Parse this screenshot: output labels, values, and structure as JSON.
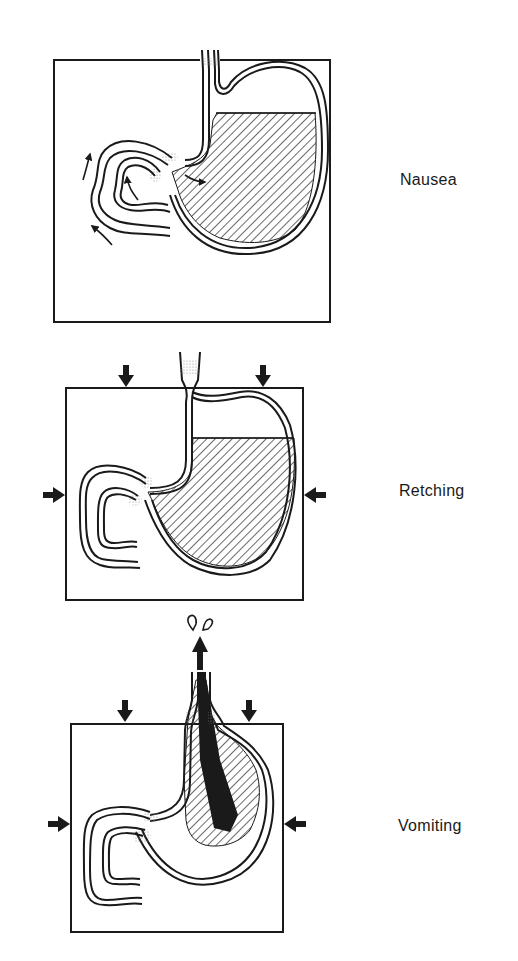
{
  "figure": {
    "panels": [
      {
        "id": "nausea",
        "label": "Nausea",
        "box": {
          "x": 54,
          "y": 60,
          "w": 276,
          "h": 262
        },
        "label_pos": {
          "x": 400,
          "y": 171
        }
      },
      {
        "id": "retching",
        "label": "Retching",
        "box": {
          "x": 66,
          "y": 388,
          "w": 237,
          "h": 212
        },
        "label_pos": {
          "x": 399,
          "y": 482
        }
      },
      {
        "id": "vomiting",
        "label": "Vomiting",
        "box": {
          "x": 71,
          "y": 724,
          "w": 212,
          "h": 208
        },
        "label_pos": {
          "x": 398,
          "y": 817
        }
      }
    ],
    "icons": {
      "compression_arrow": "down/side filled arrow",
      "flow_arrow": "thin curved arrow",
      "ejection_arrow": "bold upward arrow"
    },
    "colors": {
      "ink": "#1a1a1a",
      "background": "#ffffff",
      "stipple": "#9a9a9a"
    }
  }
}
